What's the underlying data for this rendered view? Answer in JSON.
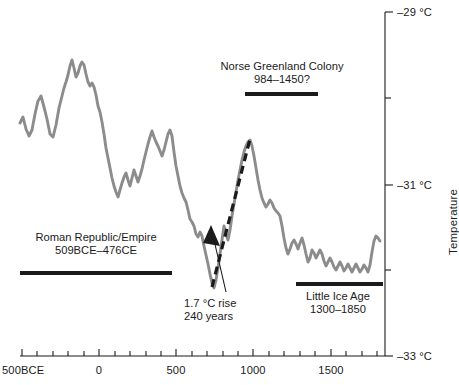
{
  "figure": {
    "background": "#ffffff",
    "series_color": "#8c8c8c",
    "accent_color": "#1b1b1b",
    "bar_color": "#1b1b1b"
  },
  "axes": {
    "y_title": "Temperature",
    "y_ticks": [
      {
        "value": -29,
        "label": "–29 °C",
        "y": 12,
        "major": true
      },
      {
        "value": -30,
        "label": "",
        "y": 98,
        "major": false
      },
      {
        "value": -31,
        "label": "–31 °C",
        "y": 185,
        "major": true
      },
      {
        "value": -32,
        "label": "",
        "y": 270,
        "major": false
      },
      {
        "value": -33,
        "label": "–33 °C",
        "y": 356,
        "major": true
      }
    ],
    "x_ticks": [
      {
        "value": -500,
        "label": "500BCE",
        "x": 22,
        "major": true
      },
      {
        "value": -400,
        "label": "",
        "x": 37,
        "major": false
      },
      {
        "value": -300,
        "label": "",
        "x": 53,
        "major": false
      },
      {
        "value": -200,
        "label": "",
        "x": 68,
        "major": false
      },
      {
        "value": -100,
        "label": "",
        "x": 84,
        "major": false
      },
      {
        "value": 0,
        "label": "0",
        "x": 99,
        "major": true
      },
      {
        "value": 100,
        "label": "",
        "x": 115,
        "major": false
      },
      {
        "value": 200,
        "label": "",
        "x": 130,
        "major": false
      },
      {
        "value": 300,
        "label": "",
        "x": 146,
        "major": false
      },
      {
        "value": 400,
        "label": "",
        "x": 161,
        "major": false
      },
      {
        "value": 500,
        "label": "500",
        "x": 176,
        "major": true
      },
      {
        "value": 600,
        "label": "",
        "x": 192,
        "major": false
      },
      {
        "value": 700,
        "label": "",
        "x": 207,
        "major": false
      },
      {
        "value": 800,
        "label": "",
        "x": 223,
        "major": false
      },
      {
        "value": 900,
        "label": "",
        "x": 238,
        "major": false
      },
      {
        "value": 1000,
        "label": "1000",
        "x": 253,
        "major": true
      },
      {
        "value": 1100,
        "label": "",
        "x": 269,
        "major": false
      },
      {
        "value": 1200,
        "label": "",
        "x": 284,
        "major": false
      },
      {
        "value": 1300,
        "label": "",
        "x": 300,
        "major": false
      },
      {
        "value": 1400,
        "label": "",
        "x": 315,
        "major": false
      },
      {
        "value": 1500,
        "label": "1500",
        "x": 331,
        "major": true
      },
      {
        "value": 1600,
        "label": "",
        "x": 346,
        "major": false
      },
      {
        "value": 1700,
        "label": "",
        "x": 362,
        "major": false
      },
      {
        "value": 1800,
        "label": "",
        "x": 377,
        "major": false
      }
    ]
  },
  "annotations": {
    "norse": {
      "line1": "Norse Greenland Colony",
      "line2": "984–1450?",
      "bar": {
        "x1": 245,
        "x2": 318,
        "y": 94
      }
    },
    "roman": {
      "line1": "Roman Republic/Empire",
      "line2": "509BCE–476CE",
      "bar": {
        "x1": 20,
        "x2": 172,
        "y": 273
      }
    },
    "little_ice_age": {
      "line1": "Little Ice Age",
      "line2": "1300–1850",
      "bar": {
        "x1": 296,
        "x2": 383,
        "y": 284
      }
    },
    "rise": {
      "line1": "1.7 °C rise",
      "line2": "240 years"
    }
  },
  "chart_data": {
    "type": "line",
    "title": "",
    "xlabel": "",
    "ylabel": "Temperature",
    "xlim": [
      -500,
      1860
    ],
    "ylim": [
      -33,
      -29
    ],
    "grid": false,
    "legend": null,
    "series": [
      {
        "name": "Greenland reconstructed temperature",
        "color": "#8c8c8c",
        "style": "solid",
        "points_px": [
          [
            20,
            123
          ],
          [
            23,
            117
          ],
          [
            26,
            129
          ],
          [
            29,
            136
          ],
          [
            32,
            130
          ],
          [
            35,
            114
          ],
          [
            38,
            101
          ],
          [
            41,
            96
          ],
          [
            44,
            107
          ],
          [
            47,
            119
          ],
          [
            50,
            134
          ],
          [
            53,
            137
          ],
          [
            56,
            125
          ],
          [
            59,
            108
          ],
          [
            62,
            96
          ],
          [
            64,
            88
          ],
          [
            66,
            82
          ],
          [
            68,
            75
          ],
          [
            70,
            66
          ],
          [
            72,
            60
          ],
          [
            74,
            68
          ],
          [
            76,
            77
          ],
          [
            78,
            73
          ],
          [
            80,
            66
          ],
          [
            82,
            62
          ],
          [
            84,
            65
          ],
          [
            86,
            74
          ],
          [
            88,
            82
          ],
          [
            90,
            86
          ],
          [
            92,
            83
          ],
          [
            94,
            87
          ],
          [
            96,
            95
          ],
          [
            98,
            106
          ],
          [
            100,
            112
          ],
          [
            102,
            122
          ],
          [
            104,
            134
          ],
          [
            106,
            148
          ],
          [
            108,
            158
          ],
          [
            110,
            168
          ],
          [
            112,
            178
          ],
          [
            114,
            186
          ],
          [
            116,
            192
          ],
          [
            118,
            197
          ],
          [
            120,
            190
          ],
          [
            122,
            183
          ],
          [
            124,
            177
          ],
          [
            126,
            173
          ],
          [
            128,
            180
          ],
          [
            130,
            186
          ],
          [
            132,
            178
          ],
          [
            134,
            170
          ],
          [
            136,
            176
          ],
          [
            138,
            182
          ],
          [
            140,
            176
          ],
          [
            142,
            169
          ],
          [
            144,
            160
          ],
          [
            146,
            152
          ],
          [
            148,
            144
          ],
          [
            150,
            137
          ],
          [
            152,
            131
          ],
          [
            154,
            137
          ],
          [
            156,
            142
          ],
          [
            158,
            146
          ],
          [
            160,
            151
          ],
          [
            162,
            156
          ],
          [
            164,
            150
          ],
          [
            166,
            142
          ],
          [
            168,
            134
          ],
          [
            170,
            130
          ],
          [
            172,
            136
          ],
          [
            174,
            152
          ],
          [
            176,
            166
          ],
          [
            178,
            176
          ],
          [
            180,
            186
          ],
          [
            182,
            193
          ],
          [
            184,
            198
          ],
          [
            186,
            202
          ],
          [
            188,
            210
          ],
          [
            190,
            219
          ],
          [
            192,
            222
          ],
          [
            194,
            226
          ],
          [
            196,
            234
          ],
          [
            198,
            237
          ],
          [
            200,
            232
          ],
          [
            202,
            236
          ],
          [
            204,
            246
          ],
          [
            206,
            255
          ],
          [
            208,
            264
          ],
          [
            210,
            274
          ],
          [
            212,
            283
          ],
          [
            214,
            288
          ],
          [
            216,
            280
          ],
          [
            218,
            268
          ],
          [
            220,
            254
          ],
          [
            222,
            240
          ],
          [
            224,
            226
          ],
          [
            226,
            234
          ],
          [
            228,
            240
          ],
          [
            230,
            230
          ],
          [
            232,
            216
          ],
          [
            234,
            204
          ],
          [
            236,
            192
          ],
          [
            238,
            180
          ],
          [
            240,
            170
          ],
          [
            242,
            160
          ],
          [
            244,
            152
          ],
          [
            246,
            146
          ],
          [
            248,
            142
          ],
          [
            250,
            140
          ],
          [
            252,
            146
          ],
          [
            254,
            156
          ],
          [
            256,
            168
          ],
          [
            258,
            180
          ],
          [
            260,
            190
          ],
          [
            262,
            198
          ],
          [
            264,
            203
          ],
          [
            266,
            207
          ],
          [
            268,
            204
          ],
          [
            270,
            200
          ],
          [
            272,
            203
          ],
          [
            274,
            208
          ],
          [
            276,
            211
          ],
          [
            278,
            213
          ],
          [
            280,
            216
          ],
          [
            282,
            226
          ],
          [
            284,
            238
          ],
          [
            286,
            248
          ],
          [
            288,
            254
          ],
          [
            290,
            249
          ],
          [
            292,
            243
          ],
          [
            294,
            240
          ],
          [
            296,
            244
          ],
          [
            298,
            249
          ],
          [
            300,
            243
          ],
          [
            302,
            238
          ],
          [
            304,
            245
          ],
          [
            306,
            254
          ],
          [
            308,
            262
          ],
          [
            310,
            258
          ],
          [
            312,
            250
          ],
          [
            314,
            253
          ],
          [
            316,
            258
          ],
          [
            318,
            254
          ],
          [
            320,
            250
          ],
          [
            322,
            254
          ],
          [
            324,
            261
          ],
          [
            326,
            266
          ],
          [
            328,
            262
          ],
          [
            330,
            258
          ],
          [
            332,
            262
          ],
          [
            334,
            267
          ],
          [
            336,
            270
          ],
          [
            338,
            266
          ],
          [
            340,
            262
          ],
          [
            342,
            266
          ],
          [
            344,
            271
          ],
          [
            346,
            268
          ],
          [
            348,
            264
          ],
          [
            350,
            268
          ],
          [
            352,
            272
          ],
          [
            354,
            268
          ],
          [
            356,
            264
          ],
          [
            358,
            268
          ],
          [
            360,
            272
          ],
          [
            362,
            269
          ],
          [
            364,
            265
          ],
          [
            366,
            268
          ],
          [
            368,
            272
          ],
          [
            370,
            265
          ],
          [
            372,
            252
          ],
          [
            374,
            241
          ],
          [
            376,
            236
          ],
          [
            378,
            238
          ],
          [
            380,
            241
          ]
        ],
        "description": "GISP2 Greenland ice core temperature, 500BCE to ~1855CE"
      },
      {
        "name": "1.7 °C rise trend",
        "color": "#1b1b1b",
        "style": "dashed",
        "points_px": [
          [
            212,
            287
          ],
          [
            250,
            139
          ]
        ],
        "description": "Dashed trend line marking a 1.7 degC rise over 240 years"
      }
    ],
    "annotations": [
      {
        "text": "Norse Greenland Colony 984–1450?",
        "span": [
          984,
          1450
        ]
      },
      {
        "text": "Roman Republic/Empire 509BCE–476CE",
        "span": [
          -509,
          476
        ]
      },
      {
        "text": "Little Ice Age 1300–1850",
        "span": [
          1300,
          1850
        ]
      },
      {
        "text": "1.7 °C rise 240 years",
        "span": [
          730,
          970
        ]
      }
    ]
  }
}
